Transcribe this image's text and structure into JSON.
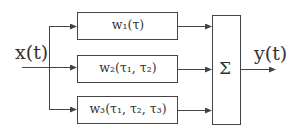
{
  "diagram": {
    "type": "block-diagram",
    "title": "",
    "input": {
      "label": "x(t)"
    },
    "output": {
      "label": "y(t)"
    },
    "blocks": [
      {
        "id": "w1",
        "label": "w₁(τ)"
      },
      {
        "id": "w2",
        "label": "w₂(τ₁, τ₂)"
      },
      {
        "id": "w3",
        "label": "w₃(τ₁, τ₂, τ₃)"
      }
    ],
    "summer": {
      "label": "Σ"
    },
    "edges": [
      {
        "from": "x(t)",
        "to": "w1"
      },
      {
        "from": "x(t)",
        "to": "w2"
      },
      {
        "from": "x(t)",
        "to": "w3"
      },
      {
        "from": "w1",
        "to": "Σ"
      },
      {
        "from": "w2",
        "to": "Σ"
      },
      {
        "from": "w3",
        "to": "Σ"
      },
      {
        "from": "Σ",
        "to": "y(t)"
      }
    ],
    "colors": {
      "stroke": "#444444",
      "text": "#333333",
      "background": "#ffffff"
    }
  }
}
